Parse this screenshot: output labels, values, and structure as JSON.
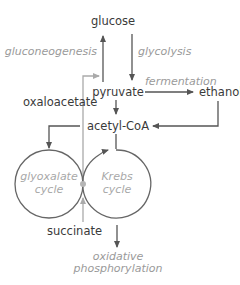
{
  "diagram": {
    "nodes": {
      "glucose": "glucose",
      "pyruvate": "pyruvate",
      "ethanol": "ethanol",
      "acetyl_coa": "acetyl-CoA",
      "oxaloacetate": "oxaloacetate",
      "succinate": "succinate"
    },
    "processes": {
      "gluconeogenesis": "gluconeogenesis",
      "glycolysis": "glycolysis",
      "fermentation": "fermentation",
      "oxidative_line1": "oxidative",
      "oxidative_line2": "phosphorylation"
    },
    "cycles": {
      "glyoxalate_line1": "glyoxalate",
      "glyoxalate_line2": "cycle",
      "krebs_line1": "Krebs",
      "krebs_line2": "cycle"
    },
    "edges": [
      {
        "from": "pyruvate",
        "to": "glucose",
        "label": "gluconeogenesis"
      },
      {
        "from": "glucose",
        "to": "pyruvate",
        "label": "glycolysis"
      },
      {
        "from": "pyruvate",
        "to": "ethanol",
        "label": "fermentation"
      },
      {
        "from": "ethanol",
        "to": "acetyl-CoA"
      },
      {
        "from": "pyruvate",
        "to": "acetyl-CoA"
      },
      {
        "from": "acetyl-CoA",
        "to": "glyoxalate cycle"
      },
      {
        "from": "acetyl-CoA",
        "to": "Krebs cycle"
      },
      {
        "from": "oxaloacetate",
        "to": "pyruvate"
      },
      {
        "from": "succinate",
        "to": "cycle junction"
      },
      {
        "from": "Krebs cycle",
        "to": "oxidative phosphorylation"
      }
    ],
    "colors": {
      "line_dark": "#555555",
      "line_light": "#aaaaaa",
      "text_dark": "#3a3a3a",
      "text_light": "#9a9a9a",
      "junction_dot": "#b5b5b5"
    }
  }
}
